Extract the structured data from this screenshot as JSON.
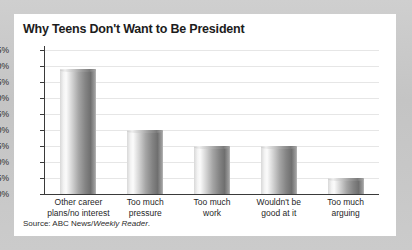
{
  "chart_data": {
    "type": "bar",
    "title": "Why Teens Don't Want to Be President",
    "categories": [
      "Other career\nplans/no interest",
      "Too much\npressure",
      "Too much\nwork",
      "Wouldn't be\ngood at it",
      "Too much\narguing"
    ],
    "values": [
      39,
      20,
      15,
      15,
      5
    ],
    "xlabel": "",
    "ylabel": "",
    "ylim": [
      0,
      45
    ],
    "ytick_step": 5,
    "ytick_labels": [
      "45%",
      "40%",
      "35%",
      "30%",
      "25%",
      "20%",
      "15%",
      "10%",
      "5%",
      "0%"
    ],
    "ytick_values": [
      45,
      40,
      35,
      30,
      25,
      20,
      15,
      10,
      5,
      0
    ],
    "grid": true,
    "legend": false,
    "unit": "%"
  },
  "chart": {
    "title": "Why Teens Don't Want to Be President",
    "source_prefix": "Source: ABC News/",
    "source_italic": "Weekly Reader",
    "source_suffix": "."
  },
  "colors": {
    "panel_background": "#ffffff",
    "outer_background": "#c9c9c9",
    "axis": "#3a3a3a",
    "gridline": "#e6e6e6",
    "bar_light": "#fbfbfb",
    "bar_dark": "#6f6f6f",
    "text": "#1c1c1c"
  }
}
